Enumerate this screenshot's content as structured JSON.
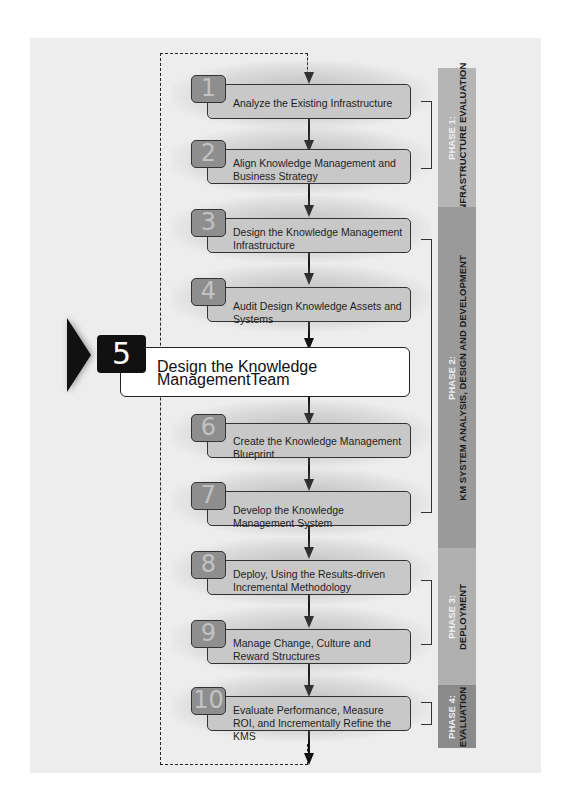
{
  "colors": {
    "panel_bg": "#ededed",
    "step_box": "#c8c8c8",
    "step_number_bg": "#8e8e8e",
    "active_box": "#ffffff",
    "active_number_bg": "#111111",
    "phase1": "#b5b5b5",
    "phase2": "#9a9a9a",
    "phase3": "#b0b0b0",
    "phase4": "#8a8a8a"
  },
  "steps": [
    {
      "number": "1",
      "label": "Analyze the Existing Infrastructure"
    },
    {
      "number": "2",
      "label": "Align Knowledge Management and Business Strategy"
    },
    {
      "number": "3",
      "label": "Design the Knowledge Management Infrastructure"
    },
    {
      "number": "4",
      "label": "Audit Design Knowledge Assets and Systems"
    },
    {
      "number": "5",
      "label": "Design the Knowledge ManagementTeam",
      "active": true
    },
    {
      "number": "6",
      "label": "Create the Knowledge Management Blueprint"
    },
    {
      "number": "7",
      "label": "Develop the Knowledge Management System"
    },
    {
      "number": "8",
      "label": "Deploy, Using the Results-driven Incremental Methodology"
    },
    {
      "number": "9",
      "label": "Manage Change, Culture and Reward Structures"
    },
    {
      "number": "10",
      "label": "Evaluate Performance, Measure ROI, and Incrementally Refine the KMS"
    }
  ],
  "phases": [
    {
      "phase": "PHASE 1:",
      "name": "INFRASTRUCTURE EVALUATION"
    },
    {
      "phase": "PHASE 2:",
      "name": "KM SYSTEM ANALYSIS, DESIGN AND DEVELOPMENT"
    },
    {
      "phase": "PHASE 3:",
      "name": "DEPLOYMENT"
    },
    {
      "phase": "PHASE 4:",
      "name": "EVALUATION"
    }
  ]
}
